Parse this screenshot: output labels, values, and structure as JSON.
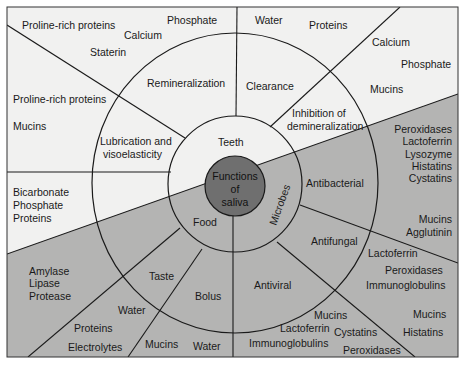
{
  "diagram": {
    "title": "Functions of saliva",
    "center": {
      "lines": [
        "Functions",
        "of",
        "saliva"
      ]
    },
    "colors": {
      "light_region": "#f1f1f0",
      "dark_region": "#b4b4b3",
      "center_fill": "#6f6f6f",
      "line": "#1a1a1a"
    },
    "inner_ring": {
      "teeth": "Teeth",
      "food": "Food",
      "microbes": "Microbes"
    },
    "middle_ring": {
      "remineralization": "Remineralization",
      "clearance": "Clearance",
      "inhibition": [
        "Inhibition of",
        "demineralization"
      ],
      "lubrication": [
        "Lubrication and",
        "visoelasticity"
      ],
      "antibacterial": "Antibacterial",
      "antifungal": "Antifungal",
      "antiviral": "Antiviral",
      "taste": "Taste",
      "bolus": "Bolus"
    },
    "outer_components": {
      "remineralization": [
        "Proline-rich proteins",
        "Calcium",
        "Staterin",
        "Phosphate"
      ],
      "clearance": [
        "Water",
        "Proteins"
      ],
      "inhibition": [
        "Calcium",
        "Phosphate",
        "Mucins"
      ],
      "lubrication": [
        "Proline-rich proteins",
        "Mucins"
      ],
      "buffering": [
        "Bicarbonate",
        "Phosphate",
        "Proteins"
      ],
      "antibacterial": [
        "Peroxidases",
        "Lactoferrin",
        "Lysozyme",
        "Histatins",
        "Cystatins",
        "Mucins",
        "Agglutinin"
      ],
      "antifungal": [
        "Lactoferrin",
        "Peroxidases",
        "Immunoglobulins",
        "Mucins",
        "Histatins"
      ],
      "antiviral": [
        "Mucins",
        "Lactoferrin",
        "Cystatins",
        "Immunoglobulins",
        "Peroxidases"
      ],
      "digestion": [
        "Amylase",
        "Lipase",
        "Protease"
      ],
      "taste": [
        "Water",
        "Proteins",
        "Electrolytes"
      ],
      "bolus": [
        "Mucins",
        "Water"
      ]
    }
  }
}
